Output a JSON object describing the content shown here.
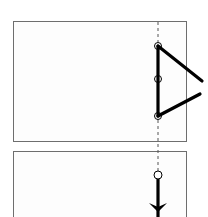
{
  "diagram": {
    "colors": {
      "panel_border": "#6e6e6e",
      "panel_fill": "#fdfdfd",
      "link": "#000000",
      "axis_dash": "#555555",
      "joint_fill": "#ffffff"
    },
    "panels": [
      {
        "id": "top",
        "box": {
          "x": 13,
          "y": 21,
          "w": 174,
          "h": 120
        },
        "axis": {
          "x": 158,
          "y1": 22,
          "y2": 141
        },
        "joints": [
          {
            "name": "top-joint",
            "x": 158,
            "y": 46,
            "r": 3.5
          },
          {
            "name": "middle-joint",
            "x": 158,
            "y": 79,
            "r": 3.5
          },
          {
            "name": "bottom-joint",
            "x": 158,
            "y": 116,
            "r": 3.5
          }
        ],
        "links": [
          {
            "name": "vertical-link",
            "x1": 158,
            "y1": 46,
            "x2": 158,
            "y2": 116
          },
          {
            "name": "upper-diagonal-link",
            "x1": 158,
            "y1": 46,
            "x2": 202,
            "y2": 81
          },
          {
            "name": "lower-diagonal-link",
            "x1": 158,
            "y1": 116,
            "x2": 200,
            "y2": 94
          }
        ]
      },
      {
        "id": "bottom",
        "box": {
          "x": 13,
          "y": 151,
          "w": 174,
          "h": 70
        },
        "axis": {
          "x": 158,
          "y1": 141,
          "y2": 173
        },
        "joints": [
          {
            "name": "hanging-joint",
            "x": 158,
            "y": 175,
            "r": 4
          }
        ],
        "links": [
          {
            "name": "hanging-link",
            "x1": 158,
            "y1": 179,
            "x2": 158,
            "y2": 217
          }
        ],
        "arrow": {
          "name": "down-arrow",
          "tip_x": 158,
          "tip_y": 213,
          "direction": "down"
        }
      }
    ]
  }
}
